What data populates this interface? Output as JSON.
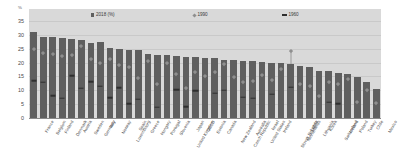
{
  "axis": {
    "unit_label": "%",
    "y_ticks": [
      0,
      5,
      10,
      15,
      20,
      25,
      30,
      35
    ],
    "y_min": 0,
    "y_max": 35
  },
  "legend": [
    {
      "label": "2018 (%)",
      "marker": "bar",
      "color": "#5f5f5f"
    },
    {
      "label": "1990",
      "marker": "diamond",
      "color": "#8f8f8f"
    },
    {
      "label": "1960",
      "marker": "dash",
      "color": "#2f2f2f"
    }
  ],
  "chart_data": {
    "type": "bar",
    "title": "",
    "subtitle": "",
    "xlabel": "",
    "ylabel": "%",
    "ylim": [
      0,
      35
    ],
    "grid": true,
    "legend_position": "top",
    "categories": [
      "France",
      "Belgium",
      "Finland",
      "Denmark",
      "Austria",
      "Sweden",
      "Germany",
      "Italy",
      "Norway",
      "Luxembourg",
      "Spain",
      "Greece",
      "Hungary",
      "Portugal",
      "Slovenia",
      "United Kingdom",
      "Japan",
      "OECD",
      "Estonia",
      "Canada",
      "New Zealand",
      "Czech Republic",
      "Australia",
      "United States",
      "Israel",
      "Ireland",
      "Slovak Republic",
      "Netherlands",
      "Latvia",
      "Lithuania",
      "Korea",
      "Switzerland",
      "Iceland",
      "Poland",
      "Turkey",
      "Chile",
      "Mexico"
    ],
    "series": [
      {
        "name": "2018 (%)",
        "marker": "bar",
        "values": [
          31.2,
          29.4,
          29.1,
          28.9,
          28.4,
          28.2,
          27.0,
          27.4,
          25.1,
          24.8,
          24.7,
          24.6,
          23.0,
          22.9,
          22.6,
          22.5,
          22.0,
          21.9,
          21.6,
          21.5,
          21.1,
          20.9,
          20.6,
          20.4,
          20.2,
          19.9,
          19.7,
          19.4,
          18.8,
          18.5,
          17.0,
          16.8,
          16.4,
          16.0,
          14.8,
          13.0,
          10.5
        ]
      },
      {
        "name": "1990",
        "marker": "diamond",
        "values": [
          24.7,
          23.5,
          23.2,
          22.4,
          22.8,
          26.1,
          21.2,
          19.7,
          21.3,
          19.1,
          18.3,
          14.5,
          20.6,
          12.1,
          19.8,
          16.0,
          10.8,
          16.5,
          15.2,
          16.7,
          19.3,
          14.8,
          13.0,
          13.3,
          15.4,
          13.7,
          17.5,
          24.0,
          12.4,
          11.5,
          7.9,
          13.1,
          12.2,
          14.0,
          5.8,
          10.2,
          5.5
        ]
      },
      {
        "name": "1960",
        "marker": "dash",
        "values": [
          13.4,
          13.0,
          8.1,
          7.2,
          15.3,
          10.8,
          13.1,
          11.5,
          7.4,
          11.0,
          5.1,
          6.8,
          null,
          3.8,
          null,
          10.2,
          4.1,
          9.8,
          null,
          8.9,
          10.1,
          null,
          7.6,
          7.1,
          null,
          8.6,
          null,
          11.2,
          null,
          null,
          null,
          5.6,
          5.1,
          null,
          null,
          null,
          null
        ]
      }
    ]
  }
}
